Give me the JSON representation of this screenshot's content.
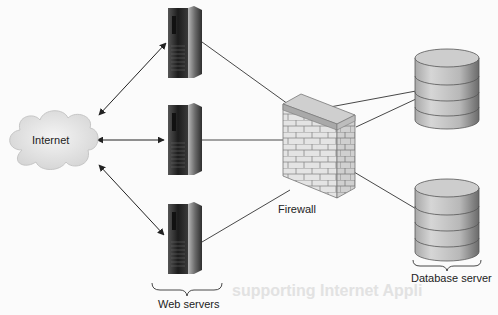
{
  "diagram": {
    "type": "network-architecture",
    "nodes": {
      "internet": {
        "label": "Internet",
        "icon": "cloud-icon"
      },
      "web_servers": {
        "label": "Web servers",
        "icon": "server-tower-icon",
        "count": 3
      },
      "firewall": {
        "label": "Firewall",
        "icon": "brick-wall-icon"
      },
      "database_server": {
        "label": "Database server",
        "icon": "database-cylinder-icon",
        "count": 2
      }
    },
    "edges": [
      {
        "from": "internet",
        "to": "web_server_1",
        "style": "bidirectional-arrow"
      },
      {
        "from": "internet",
        "to": "web_server_2",
        "style": "bidirectional-arrow"
      },
      {
        "from": "internet",
        "to": "web_server_3",
        "style": "bidirectional-arrow"
      },
      {
        "from": "web_server_1",
        "to": "firewall",
        "style": "line"
      },
      {
        "from": "web_server_2",
        "to": "firewall",
        "style": "line"
      },
      {
        "from": "web_server_3",
        "to": "firewall",
        "style": "line"
      },
      {
        "from": "firewall",
        "to": "database_1",
        "style": "line"
      },
      {
        "from": "firewall",
        "to": "database_1",
        "style": "line"
      },
      {
        "from": "firewall",
        "to": "database_2",
        "style": "line"
      }
    ],
    "colors": {
      "background": "#fbfbfb",
      "line": "#333333",
      "server_dark": "#2a2a2a",
      "cloud": "#e4e4e4",
      "firewall_brick": "#dcdcdc",
      "database_body": "#bdbdbd"
    }
  },
  "background_bleed": {
    "heading": "supporting Internet Appli"
  }
}
